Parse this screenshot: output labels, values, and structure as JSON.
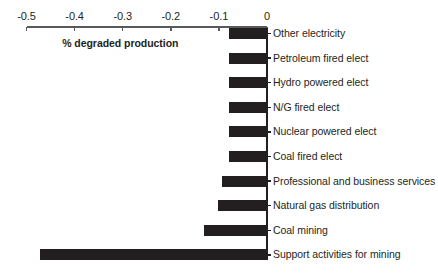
{
  "chart_data": {
    "type": "bar",
    "orientation": "horizontal",
    "title": "",
    "xlabel": "% degraded production",
    "ylabel": "",
    "xlim": [
      -0.5,
      0
    ],
    "grid": false,
    "legend": false,
    "xticks": [
      "-0.5",
      "-0.4",
      "-0.3",
      "-0.2",
      "-0.1",
      "0"
    ],
    "xtick_values": [
      -0.5,
      -0.4,
      -0.3,
      -0.2,
      -0.1,
      0
    ],
    "categories": [
      "Other electricity",
      "Petroleum fired elect",
      "Hydro powered elect",
      "N/G fired elect",
      "Nuclear powered elect",
      "Coal fired elect",
      "Professional and business services",
      "Natural gas distribution",
      "Coal mining",
      "Support activities for mining"
    ],
    "values": [
      -0.079,
      -0.079,
      -0.079,
      -0.079,
      -0.079,
      -0.079,
      -0.094,
      -0.102,
      -0.131,
      -0.472
    ],
    "bar_color": "#231f20",
    "axis_color": "#58595b"
  }
}
